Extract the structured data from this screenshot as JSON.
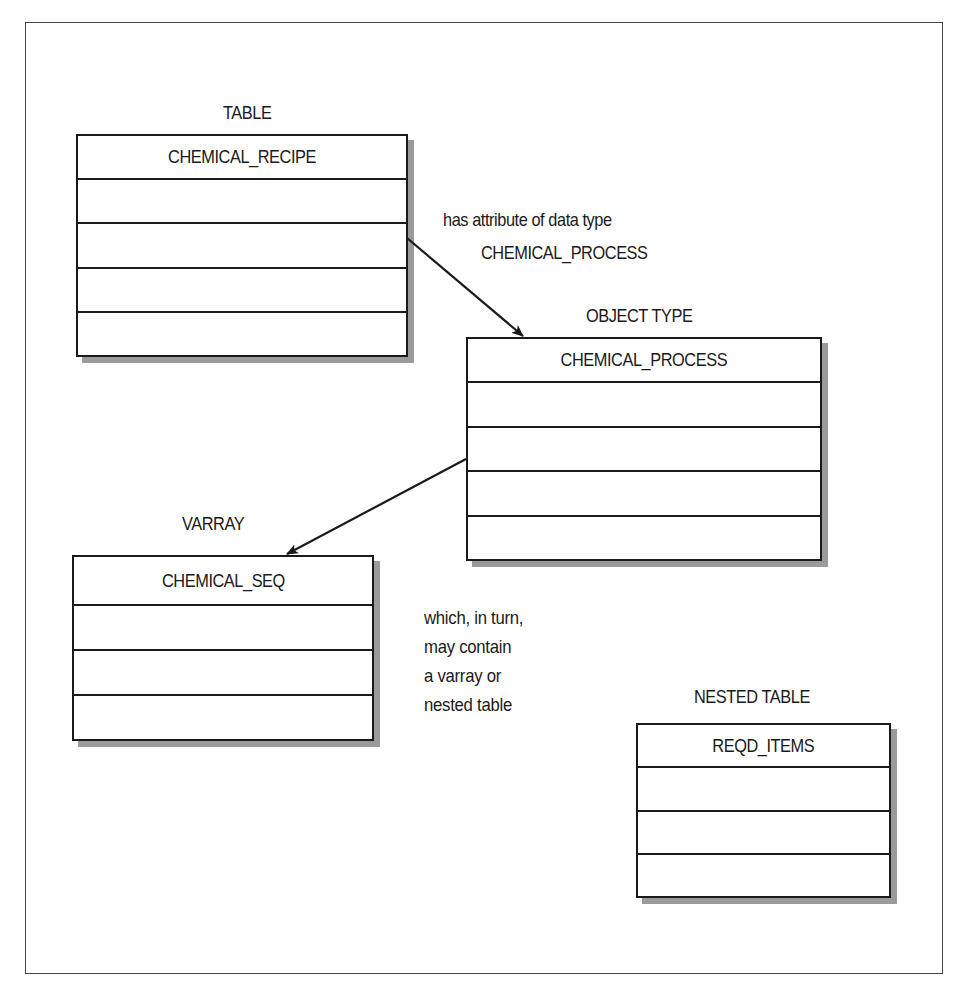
{
  "diagram": {
    "entities": [
      {
        "id": "table",
        "kind_label": "TABLE",
        "name": "CHEMICAL_RECIPE",
        "attribute_rows": 4
      },
      {
        "id": "object_type",
        "kind_label": "OBJECT TYPE",
        "name": "CHEMICAL_PROCESS",
        "attribute_rows": 4
      },
      {
        "id": "varray",
        "kind_label": "VARRAY",
        "name": "CHEMICAL_SEQ",
        "attribute_rows": 3
      },
      {
        "id": "nested_table",
        "kind_label": "NESTED TABLE",
        "name": "REQD_ITEMS",
        "attribute_rows": 3
      }
    ],
    "connections": [
      {
        "from": "table",
        "to": "object_type",
        "label_line1": "has attribute of data type",
        "label_line2": "CHEMICAL_PROCESS"
      },
      {
        "from": "object_type",
        "to": "varray"
      }
    ],
    "note": {
      "lines": [
        "which, in turn,",
        "may contain",
        "a varray or",
        "nested table"
      ]
    },
    "colors": {
      "line": "#1a1a1a",
      "shadow": "#9a9a9a",
      "frame": "#444444",
      "background": "#ffffff"
    }
  }
}
